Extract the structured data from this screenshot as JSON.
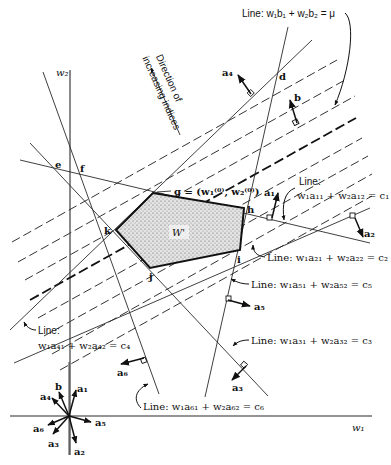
{
  "axes": {
    "x_label": "w₁",
    "y_label": "w₂"
  },
  "direction_label": {
    "line1": "Direction of",
    "line2": "increasing indices"
  },
  "region_label": "W'",
  "points": {
    "d": "d",
    "e": "e",
    "f": "f",
    "g": "g = (w₁⁽⁰⁾, w₂⁽⁰⁾)",
    "h": "h",
    "i": "i",
    "j": "j",
    "k": "k"
  },
  "lines": {
    "mu": "Line: w₁b₁ + w₂b₂ = μ",
    "c1_title": "Line:",
    "c1_eq": "w₁a₁₁ + w₂a₁₂ = c₁",
    "c2": "Line: w₁a₂₁ + w₂a₂₂ = c₂",
    "c5": "Line: w₁a₅₁ + w₂a₅₂ = c₅",
    "c3": "Line: w₁a₃₁ + w₂a₃₂ = c₃",
    "c4_title": "Line:",
    "c4_eq": "w₁a₄₁ + w₂a₄₂ = c₄",
    "c6": "Line: w₁a₆₁ + w₂a₆₂ = c₆"
  },
  "vectors": {
    "a1": "a₁",
    "a2": "a₂",
    "a3": "a₃",
    "a4": "a₄",
    "a5": "a₅",
    "a6": "a₆",
    "b": "b"
  },
  "legend_vectors": {
    "a1": "a₁",
    "a2": "a₂",
    "a3": "a₃",
    "a4": "a₄",
    "a5": "a₅",
    "a6": "a₆",
    "b": "b"
  }
}
